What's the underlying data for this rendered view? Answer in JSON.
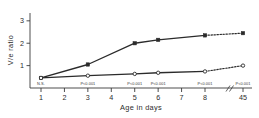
{
  "chart_data": {
    "type": "line",
    "title": "",
    "xlabel": "Age in days",
    "ylabel": "V/e ratio",
    "x": [
      1,
      3,
      5,
      6,
      8,
      45
    ],
    "xtick_labels": [
      "1",
      "2",
      "3",
      "4",
      "5",
      "6",
      "7",
      "8",
      "45"
    ],
    "xtick_values": [
      1,
      2,
      3,
      4,
      5,
      6,
      7,
      8,
      45
    ],
    "ytick_labels": [
      "1",
      "2",
      "3"
    ],
    "ytick_values": [
      1,
      2,
      3
    ],
    "ylim": [
      0,
      3.35
    ],
    "xlim": [
      0.55,
      45
    ],
    "grid": false,
    "legend": "none",
    "axis_break": true,
    "series": [
      {
        "name": "upper",
        "marker": "filled-square",
        "values": [
          0.45,
          1.05,
          2.0,
          2.15,
          2.35,
          2.45
        ],
        "dashed_from_index": 4
      },
      {
        "name": "lower",
        "marker": "open-circle",
        "values": [
          0.45,
          0.55,
          0.63,
          0.68,
          0.74,
          1.0
        ],
        "dashed_from_index": 4
      }
    ],
    "annotations": [
      {
        "x": 1,
        "text": "N.S."
      },
      {
        "x": 3,
        "text": "P<0.001"
      },
      {
        "x": 5,
        "text": "P<0.001"
      },
      {
        "x": 6,
        "text": "P<0.001"
      },
      {
        "x": 8,
        "text": "P<0.001"
      },
      {
        "x": 45,
        "text": "P<0.001"
      }
    ]
  },
  "figure": {
    "axis_color": "#3a3a3a",
    "line_color": "#2b2b2b",
    "background": "#ffffff"
  }
}
